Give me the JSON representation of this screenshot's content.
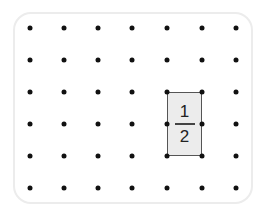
{
  "grid": {
    "columns": 7,
    "rows": 6,
    "x_positions": [
      30,
      64,
      98,
      132,
      167,
      202,
      236
    ],
    "y_positions": [
      28,
      60,
      92,
      124,
      156,
      188
    ]
  },
  "rectangle": {
    "col_start": 4,
    "col_end": 5,
    "row_start": 2,
    "row_end": 4,
    "fill": "#ececec",
    "stroke": "#555555"
  },
  "fraction": {
    "numerator": "1",
    "denominator": "2"
  }
}
